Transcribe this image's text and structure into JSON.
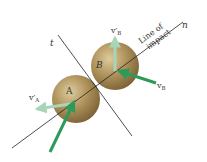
{
  "diagram": {
    "labels": {
      "axis_n": "n",
      "axis_t": "t",
      "line_of_impact_1": "Line of",
      "line_of_impact_2": "impact",
      "ball_a": "A",
      "ball_b": "B",
      "v_a_prime": "v′",
      "v_a_prime_sub": "A",
      "v_b_prime": "v′",
      "v_b_prime_sub": "B",
      "v_b": "v",
      "v_b_sub": "B"
    },
    "colors": {
      "ball_fill": "#a88a55",
      "ball_highlight": "#d8c79a",
      "ball_shadow": "#7d6335",
      "arrow_initial": "#2e9a5a",
      "arrow_final": "#a8d4b8",
      "line": "#222222",
      "text": "#333333"
    }
  }
}
